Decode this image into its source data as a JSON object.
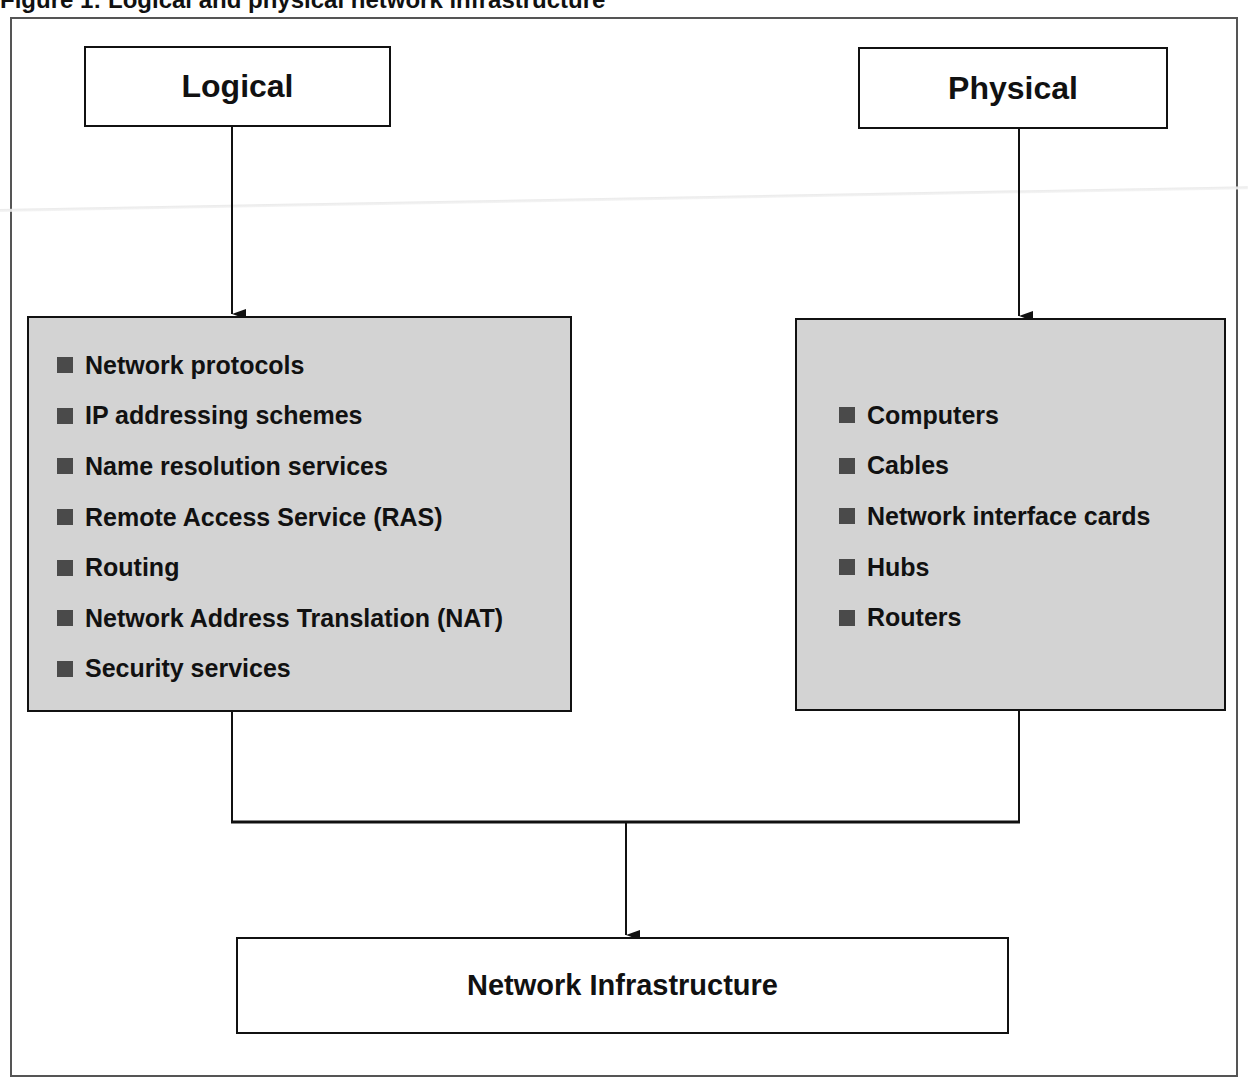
{
  "figure": {
    "title": "Figure 1: Logical and physical network infrastructure"
  },
  "logical": {
    "heading": "Logical",
    "items": [
      "Network protocols",
      "IP addressing schemes",
      "Name resolution services",
      "Remote Access Service (RAS)",
      "Routing",
      "Network Address Translation (NAT)",
      "Security services"
    ]
  },
  "physical": {
    "heading": "Physical",
    "items": [
      "Computers",
      "Cables",
      "Network interface cards",
      "Hubs",
      "Routers"
    ]
  },
  "result": {
    "label": "Network Infrastructure"
  },
  "colors": {
    "box_fill": "#d3d3d3",
    "bullet": "#4a4a4a",
    "line": "#111111"
  }
}
